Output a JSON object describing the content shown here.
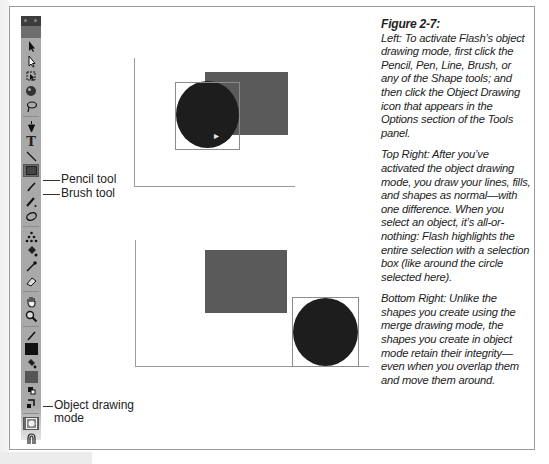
{
  "figure": {
    "title": "Figure 2-7:",
    "paragraphs": [
      "Left: To activate Flash’s object drawing mode, first click the Pencil, Pen, Line, Brush, or any of the Shape tools; and then click the Object Drawing icon that appears in the Options section of the Tools panel.",
      "Top Right: After you’ve activated the object drawing mode, you draw your lines, fills, and shapes as normal—with one difference. When you select an object, it’s all-or-nothing: Flash highlights the entire selection with a selection box (like around the circle selected here).",
      "Bottom Right: Unlike the shapes you create using the merge drawing mode, the shapes you create in object mode retain their integrity—even when you overlap them and move them around."
    ]
  },
  "callouts": {
    "pencil": "Pencil tool",
    "brush": "Brush tool",
    "object_drawing_line1": "Object drawing",
    "object_drawing_line2": "mode"
  },
  "tools_panel": {
    "tools": [
      {
        "name": "selection-tool",
        "glyph": "arrow"
      },
      {
        "name": "subselection-tool",
        "glyph": "arrow-hollow"
      },
      {
        "name": "free-transform-tool",
        "glyph": "transform"
      },
      {
        "name": "3d-rotation-tool",
        "glyph": "sphere"
      },
      {
        "name": "lasso-tool",
        "glyph": "lasso"
      },
      {
        "name": "pen-tool",
        "glyph": "pen"
      },
      {
        "name": "text-tool",
        "glyph": "T"
      },
      {
        "name": "line-tool",
        "glyph": "line"
      },
      {
        "name": "rectangle-tool",
        "glyph": "rect"
      },
      {
        "name": "pencil-tool",
        "glyph": "pencil"
      },
      {
        "name": "brush-tool",
        "glyph": "brush"
      },
      {
        "name": "deco-tool",
        "glyph": "deco"
      },
      {
        "name": "bone-tool",
        "glyph": "bone"
      },
      {
        "name": "paint-bucket-tool",
        "glyph": "bucket"
      },
      {
        "name": "eyedropper-tool",
        "glyph": "eyedropper"
      },
      {
        "name": "eraser-tool",
        "glyph": "eraser"
      },
      {
        "name": "hand-tool",
        "glyph": "hand"
      },
      {
        "name": "zoom-tool",
        "glyph": "zoom"
      }
    ],
    "colors": {
      "stroke": "#111111",
      "fill": "#555555"
    },
    "options": [
      "object-drawing",
      "snap-to-objects"
    ]
  },
  "stage": {
    "colors": {
      "rectangle": "#5a5a5a",
      "circle": "#1d1d1d",
      "selection_box": "#8c8c8c"
    }
  }
}
